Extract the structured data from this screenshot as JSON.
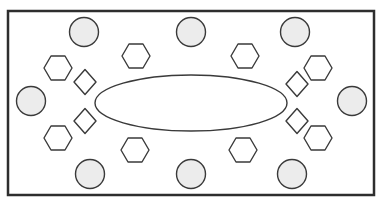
{
  "diagram": {
    "width": 389,
    "height": 205,
    "colors": {
      "background": "#ffffff",
      "frame_stroke": "#2e2e2e",
      "shape_stroke": "#3a3a3a",
      "circle_fill": "#ececec",
      "shape_fill": "#ffffff"
    },
    "frame": {
      "x": 8,
      "y": 11,
      "width": 366,
      "height": 184,
      "stroke_width": 2.5
    },
    "ellipse": {
      "cx": 191,
      "cy": 103,
      "rx": 96,
      "ry": 28
    },
    "circles": [
      {
        "cx": 84,
        "cy": 32,
        "r": 14.5
      },
      {
        "cx": 191,
        "cy": 32,
        "r": 14.5
      },
      {
        "cx": 295,
        "cy": 32,
        "r": 14.5
      },
      {
        "cx": 31,
        "cy": 101,
        "r": 14.5
      },
      {
        "cx": 352,
        "cy": 101,
        "r": 14.5
      },
      {
        "cx": 90,
        "cy": 174,
        "r": 14.5
      },
      {
        "cx": 191,
        "cy": 174,
        "r": 14.5
      },
      {
        "cx": 292,
        "cy": 174,
        "r": 14.5
      }
    ],
    "hexagons": [
      {
        "cx": 58,
        "cy": 68,
        "w": 28,
        "h": 24
      },
      {
        "cx": 136,
        "cy": 56,
        "w": 28,
        "h": 24
      },
      {
        "cx": 245,
        "cy": 56,
        "w": 28,
        "h": 24
      },
      {
        "cx": 318,
        "cy": 68,
        "w": 28,
        "h": 24
      },
      {
        "cx": 58,
        "cy": 138,
        "w": 28,
        "h": 24
      },
      {
        "cx": 135,
        "cy": 150,
        "w": 28,
        "h": 24
      },
      {
        "cx": 243,
        "cy": 150,
        "w": 28,
        "h": 24
      },
      {
        "cx": 318,
        "cy": 138,
        "w": 28,
        "h": 24
      }
    ],
    "diamonds": [
      {
        "cx": 85,
        "cy": 82,
        "w": 22,
        "h": 25
      },
      {
        "cx": 297,
        "cy": 84,
        "w": 22,
        "h": 25
      },
      {
        "cx": 85,
        "cy": 121,
        "w": 22,
        "h": 25
      },
      {
        "cx": 297,
        "cy": 121,
        "w": 22,
        "h": 25
      }
    ]
  }
}
